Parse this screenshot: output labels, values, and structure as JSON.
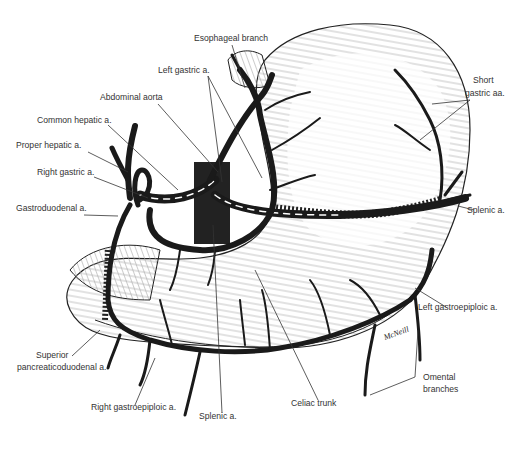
{
  "labels": {
    "esophageal_branch": "Esophageal branch",
    "left_gastric": "Left gastric a.",
    "abdominal_aorta": "Abdominal aorta",
    "common_hepatic": "Common hepatic a.",
    "proper_hepatic": "Proper hepatic a.",
    "right_gastric": "Right gastric a.",
    "gastroduodenal": "Gastroduodenal a.",
    "short_gastric_1": "Short",
    "short_gastric_2": "gastric aa.",
    "splenic_right": "Splenic a.",
    "left_gastroepiploic": "Left gastroepiploic a.",
    "superior_pd_1": "Superior",
    "superior_pd_2": "pancreaticoduodenal a.",
    "right_gastroepiploic": "Right gastroepiploic a.",
    "splenic_bottom": "Splenic a.",
    "celiac_trunk": "Celiac trunk",
    "omental_1": "Omental",
    "omental_2": "branches"
  },
  "signature": "McNeill",
  "colors": {
    "ink": "#1a1a1a",
    "hatch": "#9a9a9a",
    "label": "#333333",
    "background": "#ffffff"
  }
}
